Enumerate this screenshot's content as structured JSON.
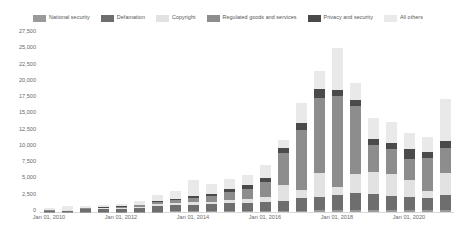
{
  "chart_data": {
    "type": "bar",
    "stacked": true,
    "title": "",
    "subtitle": "",
    "xlabel": "",
    "ylabel": "",
    "ylim": [
      0,
      27500
    ],
    "yticks": [
      0,
      2500,
      5000,
      7500,
      10000,
      12500,
      15000,
      17500,
      20000,
      22500,
      25000,
      27500
    ],
    "ytick_labels": [
      "0",
      "2,500",
      "5,000",
      "7,500",
      "10,000",
      "12,500",
      "15,000",
      "17,500",
      "20,000",
      "22,500",
      "25,000",
      "27,500"
    ],
    "grid": false,
    "legend_position": "top",
    "xtick_labels": [
      "Jan 01, 2010",
      "Jan 01, 2012",
      "Jan 01, 2014",
      "Jan 01, 2016",
      "Jan 01, 2018",
      "Jan 01, 2020"
    ],
    "xtick_indices": [
      0,
      4,
      8,
      12,
      16,
      20
    ],
    "categories": [
      "Jan 01, 2010",
      "Jul 01, 2010",
      "Jan 01, 2011",
      "Jul 01, 2011",
      "Jan 01, 2012",
      "Jul 01, 2012",
      "Jan 01, 2013",
      "Jul 01, 2013",
      "Jan 01, 2014",
      "Jul 01, 2014",
      "Jan 01, 2015",
      "Jul 01, 2015",
      "Jan 01, 2016",
      "Jul 01, 2016",
      "Jan 01, 2017",
      "Jul 01, 2017",
      "Jan 01, 2018",
      "Jul 01, 2018",
      "Jan 01, 2019",
      "Jul 01, 2019",
      "Jan 01, 2020",
      "Jul 01, 2020",
      "Jan 01, 2021"
    ],
    "series": [
      {
        "name": "National security",
        "color": "#9a9a9a",
        "values": [
          20,
          20,
          30,
          30,
          40,
          60,
          60,
          80,
          90,
          110,
          130,
          150,
          170,
          200,
          230,
          260,
          300,
          330,
          300,
          280,
          260,
          240,
          260
        ]
      },
      {
        "name": "Defamation",
        "color": "#6e6e6e",
        "values": [
          150,
          180,
          400,
          420,
          480,
          520,
          900,
          950,
          1000,
          1050,
          1200,
          1250,
          1400,
          1500,
          1900,
          2100,
          2300,
          2600,
          2400,
          2200,
          2000,
          1900,
          2300
        ]
      },
      {
        "name": "Copyright",
        "color": "#e2e2e2",
        "values": [
          60,
          80,
          100,
          120,
          150,
          200,
          250,
          300,
          400,
          450,
          500,
          600,
          800,
          2400,
          1300,
          3600,
          1200,
          2900,
          3400,
          3300,
          2600,
          1100,
          3500
        ]
      },
      {
        "name": "Regulated goods and services",
        "color": "#8d8d8d",
        "values": [
          40,
          60,
          90,
          110,
          150,
          260,
          400,
          550,
          700,
          900,
          1300,
          1600,
          2200,
          5000,
          9200,
          11500,
          14000,
          10500,
          4200,
          3900,
          3300,
          5100,
          3700
        ]
      },
      {
        "name": "Privacy and security",
        "color": "#4a4a4a",
        "values": [
          30,
          40,
          60,
          70,
          90,
          120,
          160,
          200,
          260,
          330,
          420,
          500,
          620,
          800,
          1100,
          1400,
          900,
          950,
          900,
          1000,
          1500,
          900,
          1100
        ]
      },
      {
        "name": "All others",
        "color": "#e9e9e9",
        "values": [
          250,
          600,
          300,
          330,
          400,
          600,
          900,
          1200,
          2400,
          1400,
          1500,
          1600,
          2000,
          1200,
          3000,
          2800,
          6500,
          2500,
          3300,
          3200,
          2500,
          2300,
          6500
        ]
      }
    ]
  }
}
